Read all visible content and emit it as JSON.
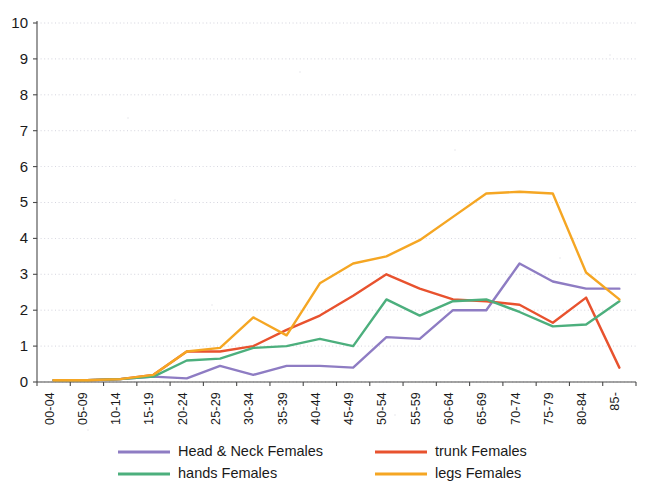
{
  "chart_data": {
    "type": "line",
    "title": "",
    "subtitle": "",
    "xlabel": "",
    "ylabel": "",
    "ylim": [
      0,
      10
    ],
    "yticks": [
      0,
      1,
      2,
      3,
      4,
      5,
      6,
      7,
      8,
      9,
      10
    ],
    "grid": true,
    "legend_position": "bottom",
    "categories": [
      "00-04",
      "05-09",
      "10-14",
      "15-19",
      "20-24",
      "25-29",
      "30-34",
      "35-39",
      "40-44",
      "45-49",
      "50-54",
      "55-59",
      "60-64",
      "65-69",
      "70-74",
      "75-79",
      "80-84",
      "85-"
    ],
    "series": [
      {
        "name": "Head & Neck  Females",
        "color": "#8e7cc3",
        "values": [
          0.05,
          0.05,
          0.08,
          0.15,
          0.1,
          0.45,
          0.2,
          0.45,
          0.45,
          0.4,
          1.25,
          1.2,
          2.0,
          2.0,
          3.3,
          2.8,
          2.6,
          2.6
        ]
      },
      {
        "name": "trunk Females",
        "color": "#e8522e",
        "values": [
          0.05,
          0.05,
          0.08,
          0.2,
          0.85,
          0.85,
          1.0,
          1.45,
          1.85,
          2.4,
          3.0,
          2.6,
          2.3,
          2.25,
          2.15,
          1.65,
          2.35,
          0.4
        ]
      },
      {
        "name": "hands Females",
        "color": "#4caf7d",
        "values": [
          0.05,
          0.05,
          0.08,
          0.15,
          0.6,
          0.65,
          0.95,
          1.0,
          1.2,
          1.0,
          2.3,
          1.85,
          2.25,
          2.3,
          1.95,
          1.55,
          1.6,
          2.25
        ]
      },
      {
        "name": "legs Females",
        "color": "#f5a623",
        "values": [
          0.05,
          0.05,
          0.08,
          0.2,
          0.85,
          0.95,
          1.8,
          1.3,
          2.75,
          3.3,
          3.5,
          3.95,
          4.6,
          5.25,
          5.3,
          5.25,
          3.05,
          2.3
        ]
      }
    ]
  },
  "legend": {
    "entries": [
      {
        "label": "Head & Neck  Females",
        "color": "#8e7cc3"
      },
      {
        "label": "trunk Females",
        "color": "#e8522e"
      },
      {
        "label": "hands Females",
        "color": "#4caf7d"
      },
      {
        "label": "legs Females",
        "color": "#f5a623"
      }
    ]
  },
  "axes": {
    "y_tick_labels": [
      "0",
      "1",
      "2",
      "3",
      "4",
      "5",
      "6",
      "7",
      "8",
      "9",
      "10"
    ],
    "x_tick_labels": [
      "00-04",
      "05-09",
      "10-14",
      "15-19",
      "20-24",
      "25-29",
      "30-34",
      "35-39",
      "40-44",
      "45-49",
      "50-54",
      "55-59",
      "60-64",
      "65-69",
      "70-74",
      "75-79",
      "80-84",
      "85-"
    ]
  }
}
